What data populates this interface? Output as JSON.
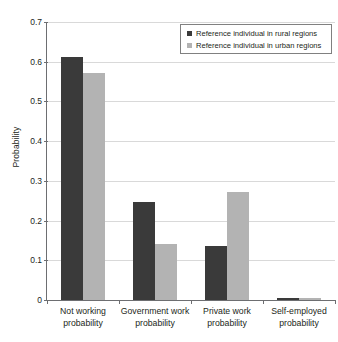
{
  "chart_data": {
    "type": "bar",
    "title": "",
    "subtitle": "",
    "xlabel": "",
    "ylabel": "Probability",
    "ylim": [
      0,
      0.7
    ],
    "grid": true,
    "legend_position": "top-right",
    "categories": [
      "Not working probability",
      "Government work probability",
      "Private work probability",
      "Self-employed probability"
    ],
    "category_lines": [
      [
        "Not working",
        "probability"
      ],
      [
        "Government work",
        "probability"
      ],
      [
        "Private work",
        "probability"
      ],
      [
        "Self-employed",
        "probability"
      ]
    ],
    "y_ticks": [
      "0",
      "0.1",
      "0.2",
      "0.3",
      "0.4",
      "0.5",
      "0.6",
      "0.7"
    ],
    "y_tick_values": [
      0,
      0.1,
      0.2,
      0.3,
      0.4,
      0.5,
      0.6,
      0.7
    ],
    "series": [
      {
        "name": "Reference individual in rural regions",
        "color": "#3a3a3a",
        "values": [
          0.612,
          0.246,
          0.135,
          0.004
        ]
      },
      {
        "name": "Reference individual in urban regions",
        "color": "#b3b3b3",
        "values": [
          0.572,
          0.142,
          0.272,
          0.004
        ]
      }
    ]
  },
  "axis": {
    "y_title": "Probability"
  },
  "legend": {
    "entries": [
      {
        "label": "Reference individual in rural regions",
        "color": "#3a3a3a"
      },
      {
        "label": "Reference individual in urban regions",
        "color": "#b3b3b3"
      }
    ]
  },
  "colors": {
    "background": "#ffffff",
    "axis": "#6d6e71",
    "gridline": "#d9d9d9",
    "text": "#231f20",
    "series_rural": "#3a3a3a",
    "series_urban": "#b3b3b3"
  }
}
